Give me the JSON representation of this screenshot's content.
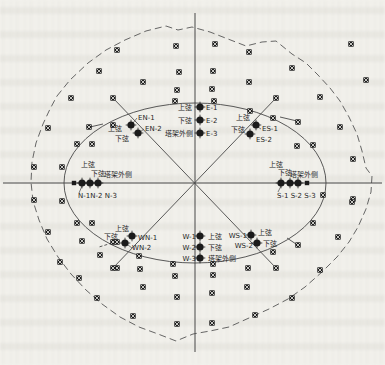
{
  "figure": {
    "type": "measurement-point-layout-diagram",
    "colors": {
      "paper": "#f3f2ed",
      "line": "#474747",
      "boundary": "#565656",
      "marker": "#1b1b1b",
      "marker_cross": "#f3f2ed",
      "text": "#1f1f1f"
    },
    "chord_labels": {
      "upper_chord": "上弦",
      "lower_chord": "下弦",
      "tower_outer_side": "塔架外侧"
    },
    "measure_point_groups": {
      "E": [
        "E-1",
        "E-2",
        "E-3"
      ],
      "EN": [
        "EN-1",
        "EN-2"
      ],
      "ES": [
        "ES-1",
        "ES-2"
      ],
      "N": [
        "N-1",
        "N-2",
        "N-3"
      ],
      "S": [
        "S-1",
        "S-2",
        "S-3"
      ],
      "WN": [
        "WN-1",
        "WN-2"
      ],
      "W": [
        "W-1",
        "W-2",
        "W-3"
      ],
      "WS": [
        "WS-1",
        "WS-2"
      ]
    }
  },
  "geometry": {
    "ellipse": {
      "cx": 195,
      "cy": 183,
      "rx": 131,
      "ry": 80
    },
    "axes": [
      {
        "x1": 195,
        "y1": 13,
        "x2": 195,
        "y2": 352
      },
      {
        "x1": 3,
        "y1": 183,
        "x2": 382,
        "y2": 183
      }
    ],
    "diagonals": [
      {
        "x1": 113,
        "y1": 98,
        "x2": 276,
        "y2": 268
      },
      {
        "x1": 276,
        "y1": 98,
        "x2": 113,
        "y2": 268
      }
    ],
    "spokes": [
      {
        "x1": 280,
        "y1": 117,
        "x2": 297,
        "y2": 121,
        "dash": false
      },
      {
        "x1": 287,
        "y1": 238,
        "x2": 296,
        "y2": 244,
        "dash": false
      },
      {
        "x1": 103,
        "y1": 124,
        "x2": 90,
        "y2": 127,
        "dash": false
      },
      {
        "x1": 112,
        "y1": 243,
        "x2": 99,
        "y2": 247,
        "dash": true
      }
    ],
    "leaders": [
      {
        "x1": 133,
        "y1": 123,
        "x2": 137,
        "y2": 118
      },
      {
        "x1": 140,
        "y1": 132,
        "x2": 144,
        "y2": 129
      },
      {
        "x1": 258,
        "y1": 127,
        "x2": 261,
        "y2": 129
      },
      {
        "x1": 82,
        "y1": 186,
        "x2": 79,
        "y2": 193
      },
      {
        "x1": 281,
        "y1": 186,
        "x2": 278,
        "y2": 192
      },
      {
        "x1": 128,
        "y1": 245,
        "x2": 132,
        "y2": 248
      }
    ],
    "boundary_points": [
      [
        57,
        96
      ],
      [
        70,
        80
      ],
      [
        88,
        63
      ],
      [
        106,
        50
      ],
      [
        125,
        40
      ],
      [
        146,
        31
      ],
      [
        166,
        26
      ],
      [
        178,
        30
      ],
      [
        192,
        27
      ],
      [
        210,
        32
      ],
      [
        228,
        39
      ],
      [
        246,
        46
      ],
      [
        262,
        42
      ],
      [
        276,
        41
      ],
      [
        292,
        54
      ],
      [
        306,
        63
      ],
      [
        318,
        75
      ],
      [
        330,
        88
      ],
      [
        340,
        101
      ],
      [
        349,
        117
      ],
      [
        357,
        134
      ],
      [
        362,
        151
      ],
      [
        366,
        168
      ],
      [
        372,
        176
      ],
      [
        371,
        192
      ],
      [
        366,
        209
      ],
      [
        358,
        227
      ],
      [
        349,
        242
      ],
      [
        337,
        257
      ],
      [
        322,
        272
      ],
      [
        305,
        287
      ],
      [
        288,
        299
      ],
      [
        269,
        309
      ],
      [
        249,
        318
      ],
      [
        229,
        327
      ],
      [
        210,
        331
      ],
      [
        193,
        334
      ],
      [
        176,
        341
      ],
      [
        158,
        334
      ],
      [
        139,
        327
      ],
      [
        120,
        317
      ],
      [
        102,
        304
      ],
      [
        86,
        290
      ],
      [
        71,
        274
      ],
      [
        58,
        257
      ],
      [
        47,
        239
      ],
      [
        39,
        220
      ],
      [
        33,
        201
      ],
      [
        31,
        182
      ],
      [
        32,
        162
      ],
      [
        36,
        143
      ],
      [
        43,
        124
      ],
      [
        50,
        109
      ]
    ],
    "grid_markers": [
      [
        176,
        46
      ],
      [
        215,
        44
      ],
      [
        179,
        72
      ],
      [
        213,
        71
      ],
      [
        177,
        90
      ],
      [
        212,
        89
      ],
      [
        117,
        50
      ],
      [
        99,
        71
      ],
      [
        143,
        82
      ],
      [
        71,
        98
      ],
      [
        48,
        128
      ],
      [
        89,
        127
      ],
      [
        77,
        144
      ],
      [
        34,
        167
      ],
      [
        62,
        167
      ],
      [
        34,
        200
      ],
      [
        62,
        201
      ],
      [
        249,
        52
      ],
      [
        292,
        68
      ],
      [
        249,
        82
      ],
      [
        320,
        97
      ],
      [
        351,
        44
      ],
      [
        366,
        80
      ],
      [
        298,
        122
      ],
      [
        313,
        145
      ],
      [
        340,
        127
      ],
      [
        353,
        159
      ],
      [
        353,
        199
      ],
      [
        297,
        146
      ],
      [
        323,
        195
      ],
      [
        352,
        202
      ],
      [
        48,
        232
      ],
      [
        77,
        223
      ],
      [
        82,
        241
      ],
      [
        60,
        262
      ],
      [
        79,
        278
      ],
      [
        100,
        255
      ],
      [
        97,
        298
      ],
      [
        117,
        268
      ],
      [
        140,
        269
      ],
      [
        143,
        287
      ],
      [
        133,
        316
      ],
      [
        113,
        242
      ],
      [
        175,
        276
      ],
      [
        213,
        275
      ],
      [
        177,
        297
      ],
      [
        212,
        293
      ],
      [
        177,
        324
      ],
      [
        212,
        323
      ],
      [
        248,
        268
      ],
      [
        273,
        252
      ],
      [
        313,
        223
      ],
      [
        338,
        237
      ],
      [
        320,
        270
      ],
      [
        292,
        298
      ],
      [
        255,
        315
      ],
      [
        247,
        287
      ],
      [
        298,
        245
      ],
      [
        113,
        98
      ],
      [
        276,
        98
      ],
      [
        113,
        268
      ],
      [
        276,
        268
      ]
    ],
    "ring_markers": [
      [
        175,
        101
      ],
      [
        214,
        101
      ],
      [
        250,
        111
      ],
      [
        273,
        118
      ],
      [
        113,
        125
      ],
      [
        92,
        144
      ],
      [
        92,
        223
      ],
      [
        117,
        242
      ],
      [
        139,
        256
      ],
      [
        173,
        264
      ],
      [
        213,
        264
      ]
    ],
    "end_squares": [
      [
        74,
        183
      ],
      [
        307,
        183
      ]
    ],
    "point_markers": [
      {
        "id": "E-1",
        "x": 200,
        "y": 107
      },
      {
        "id": "E-2",
        "x": 200,
        "y": 120
      },
      {
        "id": "E-3",
        "x": 200,
        "y": 133
      },
      {
        "id": "EN-1",
        "x": 131,
        "y": 125
      },
      {
        "id": "EN-2",
        "x": 138,
        "y": 133
      },
      {
        "id": "ES-1",
        "x": 256,
        "y": 125
      },
      {
        "id": "ES-2",
        "x": 250,
        "y": 134
      },
      {
        "id": "N-1",
        "x": 82,
        "y": 183
      },
      {
        "id": "N-2",
        "x": 90,
        "y": 183
      },
      {
        "id": "N-3",
        "x": 98,
        "y": 183
      },
      {
        "id": "S-1",
        "x": 281,
        "y": 183
      },
      {
        "id": "S-2",
        "x": 290,
        "y": 183
      },
      {
        "id": "S-3",
        "x": 298,
        "y": 183
      },
      {
        "id": "WN-1",
        "x": 132,
        "y": 236
      },
      {
        "id": "WN-2",
        "x": 125,
        "y": 243
      },
      {
        "id": "W-1",
        "x": 200,
        "y": 236
      },
      {
        "id": "W-2",
        "x": 200,
        "y": 247
      },
      {
        "id": "W-3",
        "x": 200,
        "y": 258
      },
      {
        "id": "WS-1",
        "x": 251,
        "y": 235
      },
      {
        "id": "WS-2",
        "x": 257,
        "y": 243
      }
    ]
  },
  "texts": [
    {
      "name": "label-e-upper",
      "t": "上弦",
      "x": 192,
      "y": 110,
      "a": "end"
    },
    {
      "name": "label-e-lower",
      "t": "下弦",
      "x": 192,
      "y": 123,
      "a": "end"
    },
    {
      "name": "label-e-outer",
      "t": "塔架外侧",
      "x": 193,
      "y": 136,
      "a": "end"
    },
    {
      "name": "label-e1",
      "t": "E-1",
      "x": 206,
      "y": 110,
      "a": "start"
    },
    {
      "name": "label-e2",
      "t": "E-2",
      "x": 206,
      "y": 123,
      "a": "start"
    },
    {
      "name": "label-e3",
      "t": "E-3",
      "x": 206,
      "y": 136,
      "a": "start"
    },
    {
      "name": "label-en1",
      "t": "EN-1",
      "x": 138,
      "y": 120,
      "a": "start"
    },
    {
      "name": "label-en2",
      "t": "EN-2",
      "x": 145,
      "y": 131,
      "a": "start"
    },
    {
      "name": "label-en-upper",
      "t": "上弦",
      "x": 115,
      "y": 131,
      "a": "middle"
    },
    {
      "name": "label-en-lower",
      "t": "下弦",
      "x": 122,
      "y": 141,
      "a": "middle"
    },
    {
      "name": "label-es-upper",
      "t": "上弦",
      "x": 243,
      "y": 120,
      "a": "middle"
    },
    {
      "name": "label-es-lower",
      "t": "下弦",
      "x": 238,
      "y": 132,
      "a": "middle"
    },
    {
      "name": "label-es1",
      "t": "ES-1",
      "x": 262,
      "y": 131,
      "a": "start"
    },
    {
      "name": "label-es2",
      "t": "ES-2",
      "x": 256,
      "y": 142,
      "a": "start"
    },
    {
      "name": "label-n-upper",
      "t": "上弦",
      "x": 88,
      "y": 167,
      "a": "middle"
    },
    {
      "name": "label-n-lower",
      "t": "下弦",
      "x": 98,
      "y": 176,
      "a": "middle"
    },
    {
      "name": "label-n-outer",
      "t": "塔架外侧",
      "x": 118,
      "y": 177,
      "a": "middle"
    },
    {
      "name": "label-n-ids",
      "t": "N-1N-2 N-3",
      "x": 78,
      "y": 198,
      "a": "start"
    },
    {
      "name": "label-s-upper",
      "t": "上弦",
      "x": 276,
      "y": 167,
      "a": "middle"
    },
    {
      "name": "label-s-lower",
      "t": "下弦",
      "x": 285,
      "y": 175,
      "a": "middle"
    },
    {
      "name": "label-s-outer",
      "t": "塔架外侧",
      "x": 304,
      "y": 177,
      "a": "middle"
    },
    {
      "name": "label-s-ids",
      "t": "S-1 S-2 S-3",
      "x": 277,
      "y": 198,
      "a": "start"
    },
    {
      "name": "label-wn-upper",
      "t": "上弦",
      "x": 122,
      "y": 231,
      "a": "middle"
    },
    {
      "name": "label-wn-lower",
      "t": "下弦",
      "x": 111,
      "y": 239,
      "a": "middle"
    },
    {
      "name": "label-wn1",
      "t": "WN-1",
      "x": 138,
      "y": 240,
      "a": "start"
    },
    {
      "name": "label-wn2",
      "t": "WN-2",
      "x": 132,
      "y": 250,
      "a": "start"
    },
    {
      "name": "label-w1",
      "t": "W-1",
      "x": 196,
      "y": 239,
      "a": "end"
    },
    {
      "name": "label-w2",
      "t": "W-2",
      "x": 196,
      "y": 250,
      "a": "end"
    },
    {
      "name": "label-w3",
      "t": "W-3",
      "x": 196,
      "y": 261,
      "a": "end"
    },
    {
      "name": "label-w-upper",
      "t": "上弦",
      "x": 208,
      "y": 239,
      "a": "start"
    },
    {
      "name": "label-w-lower",
      "t": "下弦",
      "x": 208,
      "y": 250,
      "a": "start"
    },
    {
      "name": "label-w-outer",
      "t": "塔架外侧",
      "x": 208,
      "y": 261,
      "a": "start"
    },
    {
      "name": "label-ws1",
      "t": "WS-1",
      "x": 247,
      "y": 238,
      "a": "end"
    },
    {
      "name": "label-ws2",
      "t": "WS-2",
      "x": 253,
      "y": 248,
      "a": "end"
    },
    {
      "name": "label-ws-upper",
      "t": "上弦",
      "x": 258,
      "y": 235,
      "a": "start"
    },
    {
      "name": "label-ws-lower",
      "t": "下弦",
      "x": 263,
      "y": 246,
      "a": "start"
    }
  ]
}
